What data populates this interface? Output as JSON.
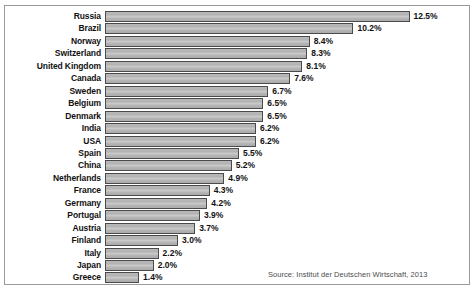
{
  "chart_data": {
    "type": "bar",
    "orientation": "horizontal",
    "title": "",
    "subtitle": "",
    "xlabel": "",
    "ylabel": "",
    "grid": false,
    "legend": null,
    "xlim": [
      0,
      13.3
    ],
    "value_suffix": "%",
    "categories": [
      "Russia",
      "Brazil",
      "Norway",
      "Switzerland",
      "United Kingdom",
      "Canada",
      "Sweden",
      "Belgium",
      "Denmark",
      "India",
      "USA",
      "Spain",
      "China",
      "Netherlands",
      "France",
      "Germany",
      "Portugal",
      "Austria",
      "Finland",
      "Italy",
      "Japan",
      "Greece"
    ],
    "values": [
      12.5,
      10.2,
      8.4,
      8.3,
      8.1,
      7.6,
      6.7,
      6.5,
      6.5,
      6.2,
      6.2,
      5.5,
      5.2,
      4.9,
      4.3,
      4.2,
      3.9,
      3.7,
      3.0,
      2.2,
      2.0,
      1.4
    ],
    "data_labels": [
      "12.5%",
      "10.2%",
      "8.4%",
      "8.3%",
      "8.1%",
      "7.6%",
      "6.7%",
      "6.5%",
      "6.5%",
      "6.2%",
      "6.2%",
      "5.5%",
      "5.2%",
      "4.9%",
      "4.3%",
      "4.2%",
      "3.9%",
      "3.7%",
      "3.0%",
      "2.2%",
      "2.0%",
      "1.4%"
    ],
    "bar_fill_color": "#b9b9b9",
    "bar_edge_color": "#4a4a4a",
    "label_color": "#111111",
    "frame_color": "#9a9a9a",
    "background_color": "#ffffff"
  },
  "annotations": {
    "source": "Source: Institut der Deutschen Wirtschaft, 2013"
  }
}
